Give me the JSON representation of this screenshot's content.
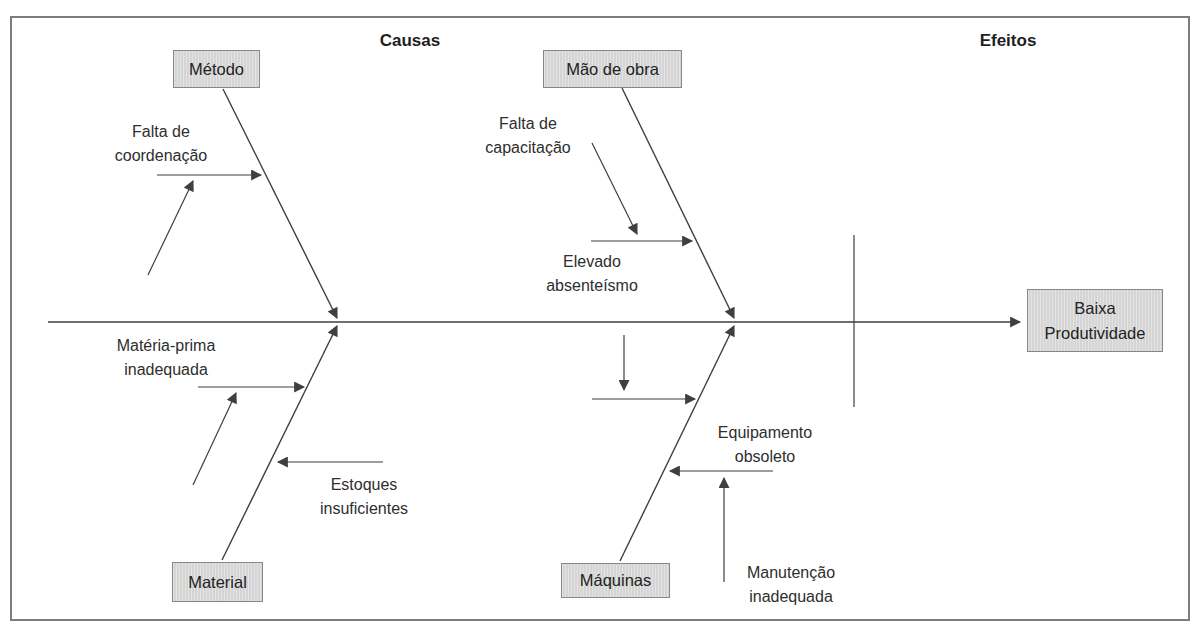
{
  "diagram": {
    "title_left": "Causas",
    "title_right": "Efeitos",
    "effect": {
      "label": "Baixa\nProdutividade"
    },
    "categories": {
      "metodo": "Método",
      "mao_de_obra": "Mão de obra",
      "material": "Material",
      "maquinas": "Máquinas"
    },
    "causes": {
      "falta_coordenacao": "Falta de\ncoordenação",
      "materia_prima": "Matéria-prima\ninadequada",
      "estoques": "Estoques\ninsuficientes",
      "falta_capacitacao": "Falta de\ncapacitação",
      "elevado_absenteismo": "Elevado\nabsenteísmo",
      "equipamento_obsoleto": "Equipamento\nobsoleto",
      "manutencao_inadequada": "Manutenção\ninadequada"
    },
    "colors": {
      "background": "#ffffff",
      "border": "#7d7d7d",
      "line": "#3f3f3f",
      "text": "#2e2e2e",
      "box_fill": "#d9d9d9",
      "box_border": "#878787"
    }
  }
}
